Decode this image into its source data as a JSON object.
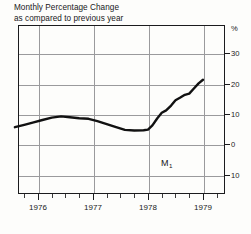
{
  "figure": {
    "title_line1": "Monthly Percentage Change",
    "title_line2": "as compared to previous year",
    "width": 251,
    "height": 234,
    "background_color": "#fdfdfb",
    "axis_color": "#1b1b1d",
    "grid_color": "#9a9a9c",
    "series_color": "#111111"
  },
  "chart_data": {
    "type": "line",
    "title": "Monthly Percentage Change as compared to previous year",
    "subtitle": "as compared to previous year",
    "xlabel": "",
    "ylabel": "%",
    "unit_label": "%",
    "grid": true,
    "legend_position": "none",
    "xlim": [
      1975.5,
      1979.5
    ],
    "ylim": [
      -15,
      35
    ],
    "yticks": [
      30,
      20,
      10,
      0,
      -10
    ],
    "ytick_labels": [
      "30",
      "20",
      "10",
      "0",
      "10"
    ],
    "xticks": [
      1976,
      1977,
      1978,
      1979
    ],
    "xtick_labels": [
      "1976",
      "1977",
      "1978",
      "1979"
    ],
    "minor_xticks_per_year": 4,
    "annotations": [
      {
        "text": "M",
        "subscript": "1",
        "x": 1978.0,
        "y": -5.5
      }
    ],
    "series": [
      {
        "name": "M1",
        "label": "M₁",
        "x": [
          1975.58,
          1975.75,
          1975.92,
          1976.08,
          1976.25,
          1976.42,
          1976.58,
          1976.75,
          1976.92,
          1977.08,
          1977.25,
          1977.42,
          1977.58,
          1977.75,
          1977.92,
          1978.0,
          1978.08,
          1978.17,
          1978.25,
          1978.33,
          1978.42,
          1978.5,
          1978.58,
          1978.67,
          1978.75,
          1978.83,
          1978.92,
          1979.0
        ],
        "values": [
          5.6,
          6.4,
          7.2,
          8.0,
          8.8,
          9.2,
          8.9,
          8.6,
          8.4,
          7.6,
          6.6,
          5.6,
          4.7,
          4.5,
          4.6,
          4.8,
          6.2,
          8.6,
          10.4,
          11.2,
          12.8,
          14.6,
          15.4,
          16.4,
          16.8,
          18.4,
          20.2,
          21.4
        ]
      }
    ]
  },
  "axes": {
    "y_entries": [
      {
        "label": "%",
        "value": 35,
        "y": 28
      },
      {
        "label": "30",
        "value": 30,
        "y": 53
      },
      {
        "label": "20",
        "value": 20,
        "y": 84
      },
      {
        "label": "10",
        "value": 10,
        "y": 114
      },
      {
        "label": "0",
        "value": 0,
        "y": 144
      },
      {
        "label": "10",
        "value": -10,
        "y": 175
      }
    ],
    "x_entries": [
      {
        "label": "1976",
        "value": 1976,
        "x": 38
      },
      {
        "label": "1977",
        "value": 1977,
        "x": 93
      },
      {
        "label": "1978",
        "value": 1978,
        "x": 148
      },
      {
        "label": "1979",
        "value": 1979,
        "x": 203
      }
    ]
  }
}
